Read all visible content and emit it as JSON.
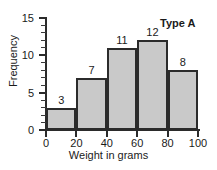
{
  "chart_data": {
    "type": "bar",
    "title": "",
    "annotation": "Type A",
    "xlabel": "Weight in grams",
    "ylabel": "Frequency",
    "categories": [
      "0-20",
      "20-40",
      "40-60",
      "60-80",
      "80-100"
    ],
    "bin_edges": [
      0,
      20,
      40,
      60,
      80,
      100
    ],
    "values": [
      3,
      7,
      11,
      12,
      8
    ],
    "value_labels": [
      "3",
      "7",
      "11",
      "12",
      "8"
    ],
    "xlim": [
      0,
      100
    ],
    "ylim": [
      0,
      15
    ],
    "x_ticks": [
      0,
      20,
      40,
      60,
      80,
      100
    ],
    "x_tick_labels": [
      "0",
      "20",
      "40",
      "60",
      "80",
      "100"
    ],
    "y_ticks": [
      0,
      5,
      10,
      15
    ],
    "y_tick_labels": [
      "0",
      "5",
      "10",
      "15"
    ],
    "y_minor_tick_step": 1,
    "grid": false,
    "legend": "none",
    "colors": {
      "bar_fill": "#c9c9c9",
      "bar_edge": "#2b2b2b",
      "axis": "#2b2b2b",
      "text": "#1a1a1a",
      "background": "#ffffff"
    }
  }
}
